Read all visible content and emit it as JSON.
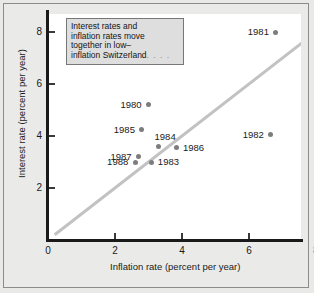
{
  "chart_data": {
    "type": "scatter",
    "title": "",
    "xlabel": "Inflation rate (percent per year)",
    "ylabel": "Interest rate (percent per year)",
    "xlim": [
      0,
      8.7
    ],
    "ylim": [
      0,
      8.7
    ],
    "xticks": [
      "0",
      "2",
      "4",
      "6",
      "8"
    ],
    "xtick_values": [
      0,
      2,
      4,
      6,
      8
    ],
    "yticks": [
      "2",
      "4",
      "6",
      "8"
    ],
    "ytick_values": [
      2,
      4,
      6,
      8
    ],
    "grid": false,
    "legend": "none",
    "points": [
      {
        "label": "1980",
        "x": 3.0,
        "y": 5.2,
        "label_pos": "left"
      },
      {
        "label": "1981",
        "x": 6.8,
        "y": 8.0,
        "label_pos": "left"
      },
      {
        "label": "1982",
        "x": 6.65,
        "y": 4.05,
        "label_pos": "left"
      },
      {
        "label": "1983",
        "x": 3.1,
        "y": 3.0,
        "label_pos": "right"
      },
      {
        "label": "1984",
        "x": 3.3,
        "y": 3.6,
        "label_pos": "above"
      },
      {
        "label": "1985",
        "x": 2.8,
        "y": 4.25,
        "label_pos": "left"
      },
      {
        "label": "1986",
        "x": 3.85,
        "y": 3.55,
        "label_pos": "right"
      },
      {
        "label": "1987",
        "x": 2.7,
        "y": 3.2,
        "label_pos": "left"
      },
      {
        "label": "1988",
        "x": 2.6,
        "y": 3.0,
        "label_pos": "left"
      }
    ],
    "reference_line": {
      "description": "45-degree line",
      "from": [
        0.2,
        0.2
      ],
      "to": [
        8.0,
        8.0
      ],
      "color": "#c2c2c2"
    },
    "colors": {
      "point": "#7d7d7d",
      "axis": "#1a1a1a",
      "reference_line": "#c2c2c2",
      "page_background": "#e9e9e7",
      "plot_background": "#ffffff",
      "caption_background": "#dedede"
    }
  },
  "caption": {
    "line1": "Interest rates and",
    "line2": "inflation rates move",
    "line3": "together in low–",
    "line4": "inflation Switzerland",
    "ellipsis": ". . . ."
  }
}
